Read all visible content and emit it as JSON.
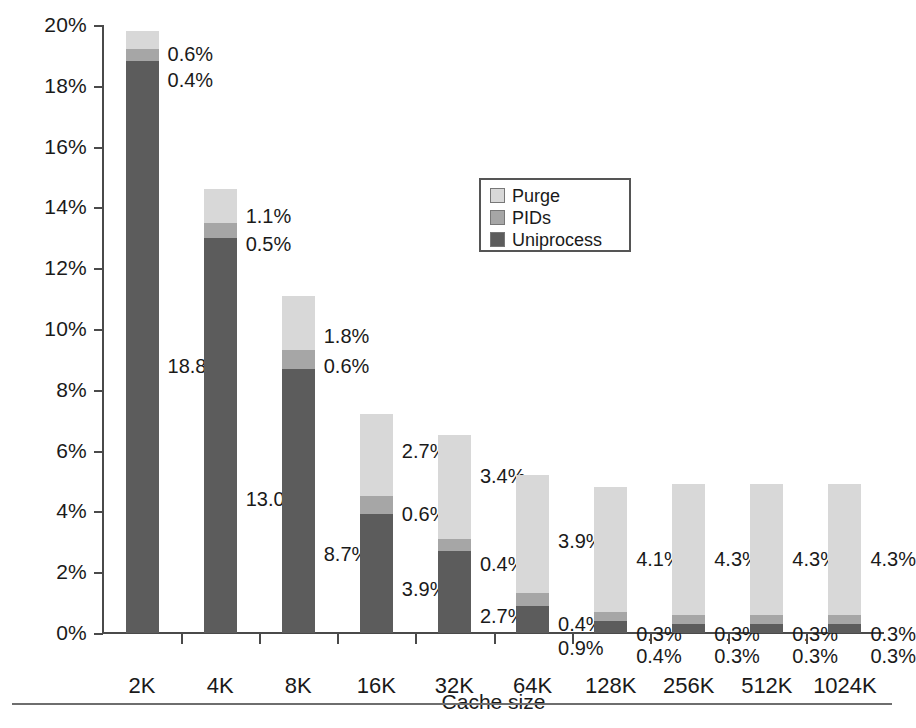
{
  "chart_data": {
    "type": "bar",
    "subtype": "stacked-bar",
    "title": "",
    "xlabel": "Cache size",
    "ylabel": "Miss rate",
    "ylim": [
      0,
      20
    ],
    "ytick_labels": [
      "20%",
      "18%",
      "16%",
      "14%",
      "12%",
      "10%",
      "8%",
      "6%",
      "4%",
      "2%",
      "0%"
    ],
    "ytick_values": [
      20,
      18,
      16,
      14,
      12,
      10,
      8,
      6,
      4,
      2,
      0
    ],
    "grid": false,
    "legend_position": "inside-upper-center",
    "categories": [
      "2K",
      "4K",
      "8K",
      "16K",
      "32K",
      "64K",
      "128K",
      "256K",
      "512K",
      "1024K"
    ],
    "series": [
      {
        "name": "Uniprocess",
        "color": "#5c5c5c",
        "values": [
          18.8,
          13.0,
          8.7,
          3.9,
          2.7,
          0.9,
          0.4,
          0.3,
          0.3,
          0.3
        ],
        "labels": [
          "18.8%",
          "13.0%",
          "8.7%",
          "3.9%",
          "2.7%",
          "0.9%",
          "0.4%",
          "0.3%",
          "0.3%",
          "0.3%"
        ]
      },
      {
        "name": "PIDs",
        "color": "#a6a6a6",
        "values": [
          0.4,
          0.5,
          0.6,
          0.6,
          0.4,
          0.4,
          0.3,
          0.3,
          0.3,
          0.3
        ],
        "labels": [
          "0.4%",
          "0.5%",
          "0.6%",
          "0.6%",
          "0.4%",
          "0.4%",
          "0.3%",
          "0.3%",
          "0.3%",
          "0.3%"
        ]
      },
      {
        "name": "Purge",
        "color": "#d8d8d8",
        "values": [
          0.6,
          1.1,
          1.8,
          2.7,
          3.4,
          3.9,
          4.1,
          4.3,
          4.3,
          4.3
        ],
        "labels": [
          "0.6%",
          "1.1%",
          "1.8%",
          "2.7%",
          "3.4%",
          "3.9%",
          "4.1%",
          "4.3%",
          "4.3%",
          "4.3%"
        ]
      }
    ],
    "totals": [
      19.8,
      14.6,
      11.1,
      7.2,
      6.5,
      5.2,
      4.8,
      4.9,
      4.9,
      4.9
    ]
  },
  "legend": {
    "items": [
      {
        "label": "Purge",
        "color": "#d8d8d8"
      },
      {
        "label": "PIDs",
        "color": "#a6a6a6"
      },
      {
        "label": "Uniprocess",
        "color": "#5c5c5c"
      }
    ]
  },
  "axes": {
    "y_title": "Miss rate",
    "x_title": "Cache size"
  },
  "caption": {
    "text": ""
  }
}
